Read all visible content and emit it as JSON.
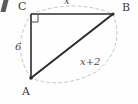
{
  "figure": {
    "kind": "right-triangle-diagram",
    "background_color": "#fefefe",
    "stroke_color": "#2b2b2b",
    "dashed_color": "#b9b9b9",
    "vertices": {
      "A": {
        "label": "A",
        "x": 31,
        "y": 78
      },
      "B": {
        "label": "B",
        "x": 113,
        "y": 14
      },
      "C": {
        "label": "C",
        "x": 31,
        "y": 14
      }
    },
    "right_angle": {
      "at_vertex": "C",
      "marker": "right-angle-square"
    },
    "sides": [
      {
        "name": "leg-vertical",
        "from": "C",
        "to": "A",
        "label": "6"
      },
      {
        "name": "leg-horizontal",
        "from": "C",
        "to": "B",
        "label": "x"
      },
      {
        "name": "hypotenuse",
        "from": "A",
        "to": "B",
        "label": "x+2"
      }
    ],
    "dashed_arc": {
      "name": "circumscribing-dashed-ellipse",
      "style": "dashed"
    },
    "corner_mark": {
      "name": "clipped-tick-mark",
      "visible": true
    }
  }
}
